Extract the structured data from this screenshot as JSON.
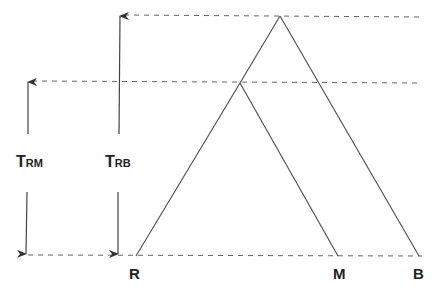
{
  "diagram": {
    "type": "phylogenetic-tree",
    "leaves": [
      {
        "label": "R",
        "x": 136,
        "y": 256
      },
      {
        "label": "M",
        "x": 338,
        "y": 256
      },
      {
        "label": "B",
        "x": 419,
        "y": 256
      }
    ],
    "nodes": {
      "root": {
        "x": 280,
        "y": 16
      },
      "rm": {
        "x": 240,
        "y": 83
      }
    },
    "baseline_y": 256,
    "times": [
      {
        "id": "trm",
        "main": "T",
        "sub": "RM",
        "arrow_x": 28,
        "top_y": 81,
        "bottom_y": 256,
        "label_x": 16,
        "label_y": 167
      },
      {
        "id": "trb",
        "main": "T",
        "sub": "RB",
        "arrow_x": 120,
        "top_y": 15,
        "bottom_y": 256,
        "label_x": 105,
        "label_y": 167
      }
    ],
    "colors": {
      "line": "#555555",
      "dash": "#666666",
      "text": "#222222"
    }
  }
}
